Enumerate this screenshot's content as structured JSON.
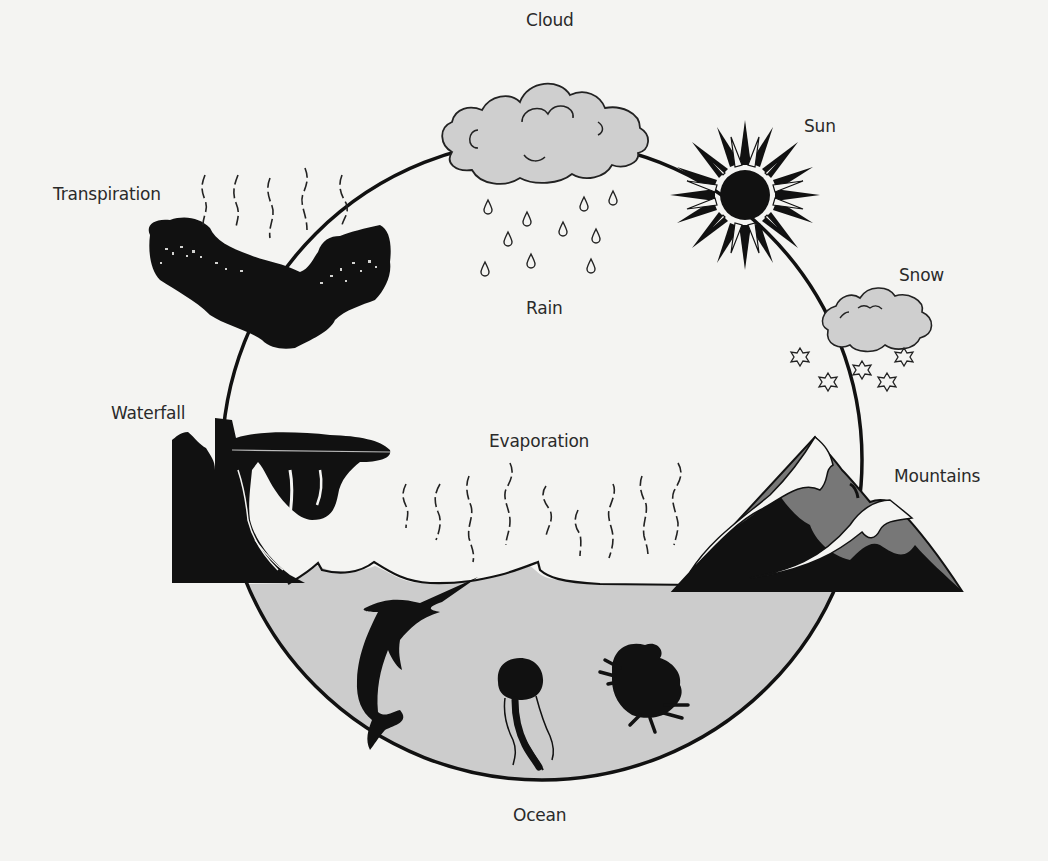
{
  "diagram": {
    "type": "water-cycle",
    "colors": {
      "background": "#f4f4f2",
      "ink": "#111111",
      "cloud_fill": "#cfcfcf",
      "ocean_fill": "#cccccc",
      "mountain_mid": "#7a7a7a",
      "snow": "#f4f4f2"
    },
    "labels": {
      "cloud": "Cloud",
      "sun": "Sun",
      "snow": "Snow",
      "rain": "Rain",
      "transpiration": "Transpiration",
      "waterfall": "Waterfall",
      "evaporation": "Evaporation",
      "mountains": "Mountains",
      "ocean": "Ocean"
    },
    "elements": [
      {
        "id": "cloud",
        "icon": "rain-cloud-icon"
      },
      {
        "id": "rain",
        "icon": "raindrops-icon",
        "count": 12
      },
      {
        "id": "sun",
        "icon": "sun-icon"
      },
      {
        "id": "snow",
        "icon": "snow-cloud-icon",
        "flakes": 5
      },
      {
        "id": "mountains",
        "icon": "mountains-icon"
      },
      {
        "id": "ocean",
        "icon": "ocean-icon",
        "creatures": [
          "swordfish",
          "jellyfish",
          "crab"
        ]
      },
      {
        "id": "waterfall",
        "icon": "waterfall-icon"
      },
      {
        "id": "transpiration",
        "icon": "tree-canopy-icon"
      },
      {
        "id": "evaporation",
        "icon": "vapor-lines-icon",
        "count": 10
      }
    ]
  }
}
